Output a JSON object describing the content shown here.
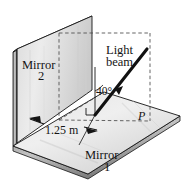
{
  "figure": {
    "type": "physics-optics-diagram",
    "background_color": "#ffffff",
    "outline_color": "#141414",
    "mirror_fill_light": "#e8e8e8",
    "mirror_fill_mid": "#d6d6d6",
    "mirror_fill_dark": "#bfbfbf",
    "edge_fill": "#9a9a9a",
    "beam_color": "#111111",
    "dash_color": "#4a4a4a"
  },
  "labels": {
    "mirror2_line1": "Mirror",
    "mirror2_line2": "2",
    "mirror1_line1": "Mirror",
    "mirror1_line2": "1",
    "light_beam_line1": "Light",
    "light_beam_line2": "beam",
    "angle": "40°",
    "distance": "1.25 m",
    "point": "P"
  },
  "measurements": {
    "distance_value": 1.25,
    "distance_unit": "m",
    "angle_value": 40,
    "angle_unit": "degrees",
    "angle_reference": "normal to mirror 1"
  }
}
